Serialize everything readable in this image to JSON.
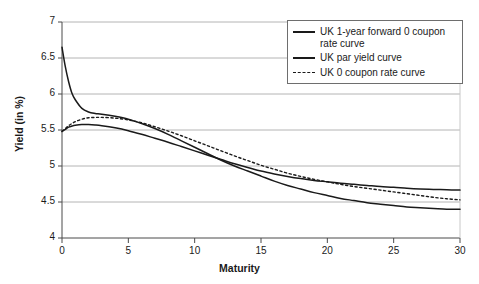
{
  "chart_data": {
    "type": "line",
    "title": "",
    "xlabel": "Maturity",
    "ylabel": "Yield (in %)",
    "xlim": [
      0,
      30
    ],
    "ylim": [
      4,
      7
    ],
    "xticks": [
      "0",
      "5",
      "10",
      "15",
      "20",
      "25",
      "30"
    ],
    "yticks": [
      "4",
      "4.5",
      "5",
      "5.5",
      "6",
      "6.5",
      "7"
    ],
    "grid": "horizontal",
    "legend_position": "top-right",
    "x": [
      0,
      0.25,
      0.5,
      0.75,
      1,
      1.5,
      2,
      2.5,
      3,
      4,
      5,
      6,
      7,
      8,
      9,
      10,
      11,
      12,
      13,
      14,
      15,
      16,
      17,
      18,
      19,
      20,
      21,
      22,
      23,
      24,
      25,
      26,
      27,
      28,
      29,
      30
    ],
    "series": [
      {
        "name": "UK 1-year forward 0 coupon rate curve",
        "style": "solid",
        "color": "#1a1a1a",
        "values": [
          6.65,
          6.38,
          6.17,
          6.01,
          5.92,
          5.8,
          5.75,
          5.73,
          5.72,
          5.69,
          5.65,
          5.59,
          5.52,
          5.44,
          5.35,
          5.26,
          5.17,
          5.08,
          5.0,
          4.93,
          4.86,
          4.79,
          4.73,
          4.68,
          4.63,
          4.59,
          4.55,
          4.52,
          4.49,
          4.47,
          4.45,
          4.43,
          4.42,
          4.41,
          4.4,
          4.4
        ]
      },
      {
        "name": "UK par yield curve",
        "style": "solid",
        "color": "#1a1a1a",
        "values": [
          5.48,
          5.51,
          5.54,
          5.555,
          5.565,
          5.575,
          5.575,
          5.57,
          5.56,
          5.53,
          5.49,
          5.44,
          5.385,
          5.33,
          5.27,
          5.21,
          5.15,
          5.09,
          5.03,
          4.98,
          4.93,
          4.89,
          4.855,
          4.825,
          4.8,
          4.78,
          4.76,
          4.745,
          4.73,
          4.715,
          4.705,
          4.69,
          4.68,
          4.675,
          4.67,
          4.665
        ]
      },
      {
        "name": "UK 0 coupon rate curve",
        "style": "dashed",
        "color": "#1a1a1a",
        "values": [
          5.48,
          5.52,
          5.56,
          5.59,
          5.615,
          5.65,
          5.67,
          5.675,
          5.675,
          5.665,
          5.64,
          5.6,
          5.545,
          5.485,
          5.42,
          5.35,
          5.28,
          5.21,
          5.14,
          5.075,
          5.01,
          4.955,
          4.9,
          4.855,
          4.815,
          4.78,
          4.745,
          4.715,
          4.69,
          4.665,
          4.64,
          4.615,
          4.59,
          4.565,
          4.545,
          4.53
        ]
      }
    ]
  },
  "legend": {
    "items": [
      {
        "label": "UK 1-year forward 0 coupon rate curve",
        "style": "solid"
      },
      {
        "label": "UK par yield curve",
        "style": "solid"
      },
      {
        "label": "UK 0 coupon rate curve",
        "style": "dashed"
      }
    ]
  },
  "axes": {
    "y_label": "Yield (in %)",
    "x_label": "Maturity"
  }
}
